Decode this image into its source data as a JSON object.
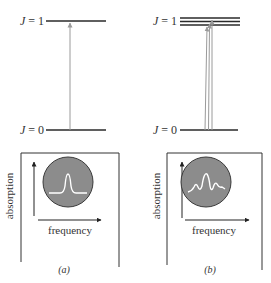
{
  "panels": [
    {
      "id": "a",
      "caption": "(a)",
      "levels": {
        "upper": "J = 1",
        "lower": "J = 0",
        "upper_j": "J",
        "upper_v": " = 1",
        "lower_j": "J",
        "lower_v": " = 0"
      },
      "upper_sublevels": 1,
      "transitions": 1,
      "spectrum": {
        "xlabel": "frequency",
        "ylabel": "absorption",
        "shape": "single-peak"
      }
    },
    {
      "id": "b",
      "caption": "(b)",
      "levels": {
        "upper": "J = 1",
        "lower": "J = 0",
        "upper_j": "J",
        "upper_v": " = 1",
        "lower_j": "J",
        "lower_v": " = 0"
      },
      "upper_sublevels": 3,
      "transitions": 3,
      "spectrum": {
        "xlabel": "frequency",
        "ylabel": "absorption",
        "shape": "multi-peak"
      }
    }
  ],
  "colors": {
    "level_line": "#2a2a2a",
    "arrow": "#9a9a9a",
    "circle_fill": "#8c8c8c",
    "circle_stroke": "#3a3a3a",
    "spectrum_line": "#ffffff",
    "frame": "#333333"
  }
}
